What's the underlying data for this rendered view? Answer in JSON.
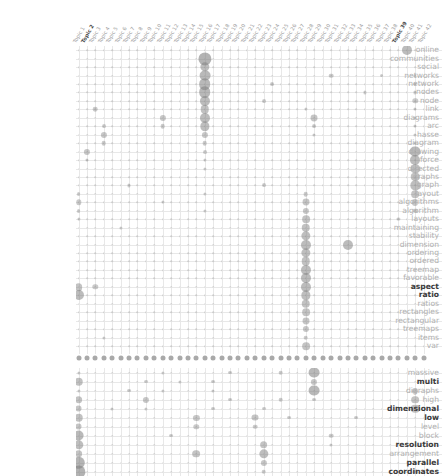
{
  "figure": {
    "type": "bubble-matrix",
    "title": "",
    "background": "#ffffff",
    "bubble_color": "#808080",
    "grid_color": "#e8e8e8",
    "label_color": "#b0b0b0",
    "highlight_label_color": "#3b3b3b"
  },
  "columns": {
    "label_prefix": "Topic",
    "count": 42,
    "labels": [
      "Topic 1",
      "Topic 2",
      "Topic 3",
      "Topic 4",
      "Topic 5",
      "Topic 6",
      "Topic 7",
      "Topic 8",
      "Topic 9",
      "Topic 10",
      "Topic 11",
      "Topic 12",
      "Topic 13",
      "Topic 14",
      "Topic 15",
      "Topic 16",
      "Topic 17",
      "Topic 18",
      "Topic 19",
      "Topic 20",
      "Topic 21",
      "Topic 22",
      "Topic 23",
      "Topic 24",
      "Topic 25",
      "Topic 26",
      "Topic 27",
      "Topic 28",
      "Topic 29",
      "Topic 30",
      "Topic 31",
      "Topic 32",
      "Topic 33",
      "Topic 34",
      "Topic 35",
      "Topic 36",
      "Topic 37",
      "Topic 38",
      "Topic 39",
      "Topic 40",
      "Topic 41",
      "Topic 42"
    ],
    "bold_indices": [
      1,
      38
    ]
  },
  "panels": [
    {
      "name": "upper-panel",
      "rows": [
        "online",
        "communities",
        "social",
        "networks",
        "network",
        "nodes",
        "node",
        "link",
        "diagrams",
        "arc",
        "hasse",
        "diagram",
        "drawing",
        "force",
        "directed",
        "graphs",
        "graph",
        "layout",
        "algorithms",
        "algorithm",
        "layouts",
        "maintaining",
        "stability",
        "dimension",
        "ordering",
        "ordered",
        "treemap",
        "favorable",
        "aspect",
        "ratio",
        "ratios",
        "rectangles",
        "rectangular",
        "treemaps",
        "items",
        "var"
      ],
      "bold_rows": [
        "aspect",
        "ratio"
      ]
    },
    {
      "name": "lower-panel",
      "rows": [
        "massive",
        "multi",
        "digraphs",
        "high",
        "dimensional",
        "low",
        "level",
        "block",
        "resolution",
        "arrangement",
        "parallel",
        "coordinates"
      ],
      "bold_rows": [
        "multi",
        "dimensional",
        "low",
        "resolution",
        "parallel",
        "coordinates"
      ]
    }
  ],
  "chart_data": {
    "type": "heatmap",
    "encoding": "circle-area",
    "xlabel": "Topics",
    "ylabel": "Terms",
    "grid": true,
    "legend": "none",
    "x": [
      "Topic 1",
      "Topic 2",
      "Topic 3",
      "Topic 4",
      "Topic 5",
      "Topic 6",
      "Topic 7",
      "Topic 8",
      "Topic 9",
      "Topic 10",
      "Topic 11",
      "Topic 12",
      "Topic 13",
      "Topic 14",
      "Topic 15",
      "Topic 16",
      "Topic 17",
      "Topic 18",
      "Topic 19",
      "Topic 20",
      "Topic 21",
      "Topic 22",
      "Topic 23",
      "Topic 24",
      "Topic 25",
      "Topic 26",
      "Topic 27",
      "Topic 28",
      "Topic 29",
      "Topic 30",
      "Topic 31",
      "Topic 32",
      "Topic 33",
      "Topic 34",
      "Topic 35",
      "Topic 36",
      "Topic 37",
      "Topic 38",
      "Topic 39",
      "Topic 40",
      "Topic 41",
      "Topic 42"
    ],
    "upper_rows": [
      "online",
      "communities",
      "social",
      "networks",
      "network",
      "nodes",
      "node",
      "link",
      "diagrams",
      "arc",
      "hasse",
      "diagram",
      "drawing",
      "force",
      "directed",
      "graphs",
      "graph",
      "layout",
      "algorithms",
      "algorithm",
      "layouts",
      "maintaining",
      "stability",
      "dimension",
      "ordering",
      "ordered",
      "treemap",
      "favorable",
      "aspect",
      "ratio",
      "ratios",
      "rectangles",
      "rectangular",
      "treemaps",
      "items",
      "var"
    ],
    "lower_rows": [
      "massive",
      "multi",
      "digraphs",
      "high",
      "dimensional",
      "low",
      "level",
      "block",
      "resolution",
      "arrangement",
      "parallel",
      "coordinates"
    ],
    "value_range": [
      0,
      10
    ],
    "upper_points": [
      [
        39,
        0,
        6.5
      ],
      [
        15,
        1,
        8.5
      ],
      [
        15,
        2,
        6.0
      ],
      [
        15,
        3,
        7.0
      ],
      [
        30,
        3,
        3.0
      ],
      [
        36,
        3,
        2.5
      ],
      [
        40,
        3,
        2.0
      ],
      [
        15,
        4,
        7.5
      ],
      [
        23,
        4,
        2.5
      ],
      [
        40,
        4,
        2.0
      ],
      [
        15,
        5,
        7.5
      ],
      [
        34,
        5,
        2.0
      ],
      [
        40,
        5,
        2.0
      ],
      [
        15,
        6,
        6.5
      ],
      [
        22,
        6,
        2.5
      ],
      [
        40,
        6,
        3.5
      ],
      [
        2,
        7,
        3.0
      ],
      [
        15,
        7,
        5.5
      ],
      [
        27,
        7,
        2.0
      ],
      [
        40,
        7,
        2.0
      ],
      [
        10,
        8,
        4.0
      ],
      [
        15,
        8,
        6.5
      ],
      [
        28,
        8,
        4.5
      ],
      [
        40,
        8,
        2.0
      ],
      [
        3,
        9,
        2.5
      ],
      [
        10,
        9,
        3.0
      ],
      [
        15,
        9,
        6.0
      ],
      [
        28,
        9,
        2.5
      ],
      [
        40,
        9,
        2.0
      ],
      [
        3,
        10,
        4.0
      ],
      [
        15,
        10,
        4.0
      ],
      [
        28,
        10,
        2.0
      ],
      [
        40,
        10,
        2.0
      ],
      [
        3,
        11,
        3.0
      ],
      [
        15,
        11,
        3.0
      ],
      [
        40,
        11,
        2.0
      ],
      [
        1,
        12,
        4.0
      ],
      [
        15,
        12,
        2.5
      ],
      [
        40,
        12,
        7.0
      ],
      [
        1,
        13,
        2.0
      ],
      [
        15,
        13,
        2.0
      ],
      [
        40,
        13,
        6.5
      ],
      [
        15,
        14,
        2.0
      ],
      [
        40,
        14,
        6.0
      ],
      [
        40,
        15,
        5.5
      ],
      [
        6,
        16,
        2.0
      ],
      [
        22,
        16,
        2.5
      ],
      [
        40,
        16,
        6.0
      ],
      [
        0,
        17,
        2.5
      ],
      [
        15,
        17,
        2.0
      ],
      [
        27,
        17,
        3.0
      ],
      [
        40,
        17,
        5.0
      ],
      [
        0,
        18,
        3.5
      ],
      [
        10,
        18,
        2.0
      ],
      [
        27,
        18,
        4.5
      ],
      [
        40,
        18,
        4.0
      ],
      [
        0,
        19,
        2.5
      ],
      [
        15,
        19,
        2.0
      ],
      [
        27,
        19,
        4.0
      ],
      [
        40,
        19,
        3.0
      ],
      [
        0,
        20,
        2.0
      ],
      [
        27,
        20,
        5.0
      ],
      [
        38,
        20,
        2.0
      ],
      [
        5,
        21,
        2.0
      ],
      [
        27,
        21,
        5.5
      ],
      [
        27,
        22,
        6.0
      ],
      [
        27,
        23,
        6.5
      ],
      [
        32,
        23,
        6.5
      ],
      [
        27,
        24,
        6.0
      ],
      [
        27,
        25,
        5.5
      ],
      [
        27,
        26,
        6.5
      ],
      [
        27,
        27,
        6.5
      ],
      [
        0,
        28,
        5.0
      ],
      [
        2,
        28,
        3.5
      ],
      [
        27,
        28,
        6.5
      ],
      [
        0,
        29,
        6.5
      ],
      [
        27,
        29,
        6.0
      ],
      [
        27,
        30,
        5.5
      ],
      [
        27,
        31,
        5.0
      ],
      [
        27,
        32,
        4.5
      ],
      [
        27,
        33,
        4.0
      ],
      [
        3,
        34,
        2.0
      ],
      [
        27,
        34,
        3.0
      ],
      [
        27,
        35,
        5.0
      ]
    ],
    "lower_points": [
      [
        0,
        0,
        2.0
      ],
      [
        28,
        0,
        7.0
      ],
      [
        10,
        0,
        2.0
      ],
      [
        18,
        0,
        2.5
      ],
      [
        24,
        0,
        3.0
      ],
      [
        42,
        0,
        4.0
      ],
      [
        0,
        1,
        5.5
      ],
      [
        8,
        1,
        2.5
      ],
      [
        12,
        1,
        2.0
      ],
      [
        16,
        1,
        2.5
      ],
      [
        28,
        1,
        4.0
      ],
      [
        42,
        1,
        5.0
      ],
      [
        0,
        2,
        2.0
      ],
      [
        6,
        2,
        2.5
      ],
      [
        10,
        2,
        2.0
      ],
      [
        16,
        2,
        2.0
      ],
      [
        28,
        2,
        7.0
      ],
      [
        40,
        2,
        4.0
      ],
      [
        42,
        2,
        3.0
      ],
      [
        0,
        3,
        5.0
      ],
      [
        8,
        3,
        4.0
      ],
      [
        18,
        3,
        2.5
      ],
      [
        24,
        3,
        3.0
      ],
      [
        28,
        3,
        2.5
      ],
      [
        40,
        3,
        5.0
      ],
      [
        42,
        3,
        4.5
      ],
      [
        0,
        4,
        4.5
      ],
      [
        4,
        4,
        2.0
      ],
      [
        8,
        4,
        2.0
      ],
      [
        16,
        4,
        2.5
      ],
      [
        22,
        4,
        2.5
      ],
      [
        40,
        4,
        5.5
      ],
      [
        42,
        4,
        3.0
      ],
      [
        0,
        5,
        5.5
      ],
      [
        14,
        5,
        4.0
      ],
      [
        21,
        5,
        4.5
      ],
      [
        25,
        5,
        2.5
      ],
      [
        33,
        5,
        2.5
      ],
      [
        42,
        5,
        4.0
      ],
      [
        0,
        6,
        4.5
      ],
      [
        14,
        6,
        3.5
      ],
      [
        21,
        6,
        3.0
      ],
      [
        42,
        6,
        5.0
      ],
      [
        0,
        7,
        7.0
      ],
      [
        11,
        7,
        2.5
      ],
      [
        30,
        7,
        3.0
      ],
      [
        42,
        7,
        3.0
      ],
      [
        0,
        8,
        6.0
      ],
      [
        22,
        8,
        5.0
      ],
      [
        30,
        8,
        2.0
      ],
      [
        42,
        8,
        2.5
      ],
      [
        0,
        9,
        5.0
      ],
      [
        22,
        9,
        6.0
      ],
      [
        14,
        9,
        5.0
      ],
      [
        42,
        9,
        2.0
      ],
      [
        0,
        10,
        8.0
      ],
      [
        22,
        10,
        4.0
      ],
      [
        42,
        10,
        2.0
      ],
      [
        0,
        11,
        8.5
      ],
      [
        22,
        11,
        3.0
      ],
      [
        40,
        11,
        3.0
      ]
    ]
  }
}
